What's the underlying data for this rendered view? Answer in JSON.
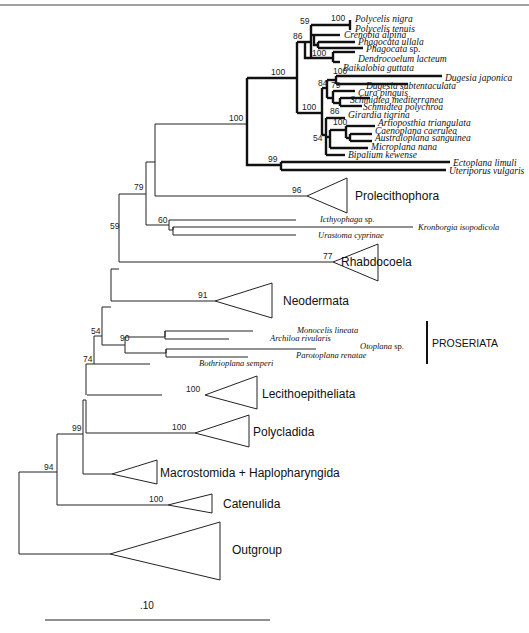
{
  "figure": {
    "type": "phylogenetic-tree",
    "scale_bar": {
      "label": ".10"
    }
  },
  "taxa": {
    "polycelis_nigra": "Polycelis nigra",
    "polycelis_tenuis": "Polycelis tenuis",
    "crenobia_alpina": "Crenobia alpina",
    "phagocata_ullala": "Phagocata ullala",
    "phagocata_sp_genus": "Phagocata",
    "phagocata_sp_suffix": " sp.",
    "dendrocoelum_lacteum": "Dendrocoelum lacteum",
    "baikalobia_guttata": "Baikalobia guttata",
    "dugesia_japonica": "Dugesia japonica",
    "dugesia_subtentaculata": "Dugesia subtentaculata",
    "cura_pinguis": "Cura pinguis",
    "schmidtea_mediterranea": "Schmidtea mediterranea",
    "schmidtea_polychroa": "Schmidtea polychroa",
    "girardia_tigrina": "Girardia tigrina",
    "artioposthia_triangulata": "Artioposthia triangulata",
    "caenoplana_caerulea": "Caenoplana caerulea",
    "australoplana_sanguinea": "Australoplana sanguinea",
    "microplana_nana": "Microplana nana",
    "bipalium_kewense": "Bipalium kewense",
    "ectoplana_limuli": "Ectoplana limuli",
    "uteriporus_vulgaris": "Uteriporus vulgaris",
    "icthyophaga_genus": "Icthyophaga",
    "icthyophaga_suffix": " sp.",
    "kronborgia_isopodicola": "Kronborgia isopodicola",
    "urastoma_cyprinae": "Urastoma cyprinae",
    "monocelis_lineata": "Monocelis lineata",
    "archiloa_rivularis": "Archiloa rivularis",
    "otoplana_genus": "Otoplana",
    "otoplana_suffix": " sp.",
    "parotoplana_renatae": "Parotoplana renatae",
    "bothrioplana_semperi": "Bothrioplana semperi"
  },
  "clades": {
    "prolecithophora": "Prolecithophora",
    "rhabdocoela": "Rhabdocoela",
    "neodermata": "Neodermata",
    "proseriata": "PROSERIATA",
    "lecithoepitheliata": "Lecithoepitheliata",
    "polycladida": "Polycladida",
    "macrostomida": "Macrostomida + Haplopharyngida",
    "catenulida": "Catenulida",
    "outgroup": "Outgroup"
  },
  "bootstrap": {
    "polycelis": "100",
    "n59_top": "59",
    "n86_top": "86",
    "dendro": "100",
    "triclad": "100",
    "dugesia": "100",
    "n84": "84",
    "n79_top": "79",
    "dugesiidae": "100",
    "n86_schmidtea": "86",
    "terrestrial": "100",
    "n54_top": "54",
    "tricladida": "100",
    "maricola_cave": "99",
    "prolecitho": "96",
    "n79": "79",
    "n60": "60",
    "n59": "59",
    "rhabdo": "77",
    "neoderm": "91",
    "n90": "90",
    "n54": "54",
    "n74": "74",
    "lecitho": "100",
    "n99": "99",
    "polyclad": "100",
    "n94": "94",
    "catenul": "100"
  }
}
